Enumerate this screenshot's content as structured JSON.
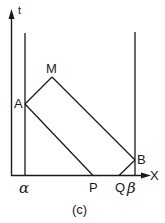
{
  "figure": {
    "caption": "(c)",
    "axes": {
      "x_label": "X",
      "y_label": "t"
    },
    "boundaries": {
      "left": "α",
      "right": "β"
    },
    "points": {
      "A": "A",
      "M": "M",
      "B": "B",
      "P": "P",
      "Q": "Q"
    },
    "line_color": "#1a1a1a"
  }
}
